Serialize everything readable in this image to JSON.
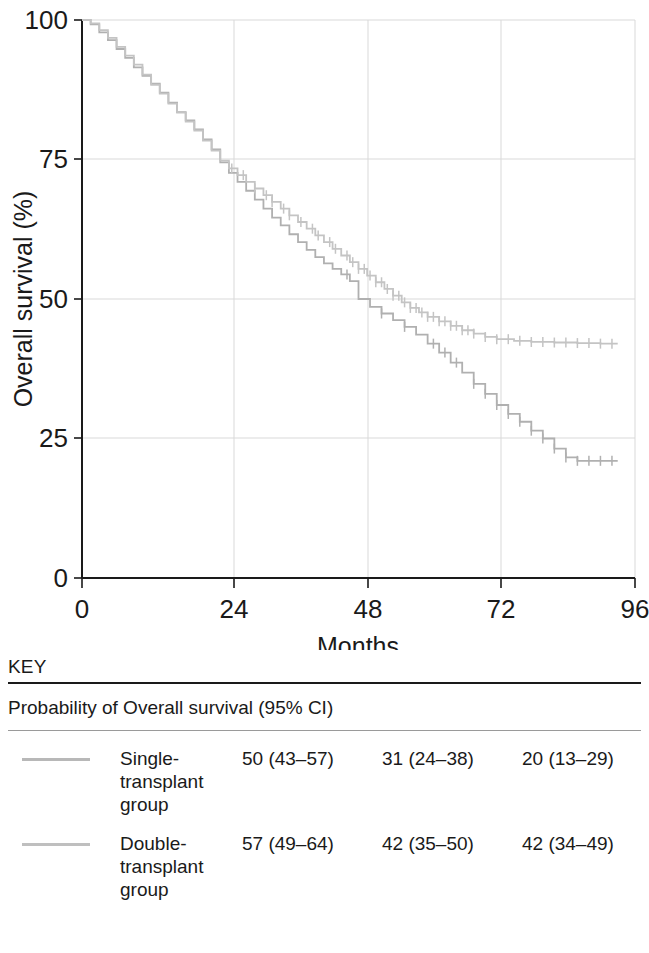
{
  "chart_data": {
    "type": "line",
    "title": "",
    "subtype": "kaplan-meier-survival",
    "xlabel": "Months",
    "ylabel": "Overall survival (%)",
    "xlim": [
      0,
      96
    ],
    "ylim": [
      0,
      100
    ],
    "xticks": [
      "0",
      "24",
      "48",
      "72",
      "96"
    ],
    "xtick_values": [
      0,
      24,
      48,
      72,
      96
    ],
    "yticks": [
      "0",
      "25",
      "50",
      "75",
      "100"
    ],
    "ytick_values": [
      0,
      25,
      50,
      75,
      100
    ],
    "grid": "horizontal-and-vertical-light",
    "legend_position": "below-plot",
    "series": [
      {
        "name": "Single-transplant group",
        "color": "#b0b0b0",
        "points": [
          [
            0,
            100
          ],
          [
            1.5,
            99.2
          ],
          [
            3,
            97.8
          ],
          [
            4.5,
            96.4
          ],
          [
            6,
            94.8
          ],
          [
            7.5,
            93.2
          ],
          [
            9,
            91.5
          ],
          [
            10.5,
            90.0
          ],
          [
            12,
            88.6
          ],
          [
            13.5,
            87.0
          ],
          [
            15,
            85.2
          ],
          [
            16.5,
            83.5
          ],
          [
            18,
            82.0
          ],
          [
            19.5,
            80.4
          ],
          [
            21,
            78.6
          ],
          [
            22.5,
            76.8
          ],
          [
            24,
            74.5
          ],
          [
            25.5,
            72.6
          ],
          [
            27,
            71.0
          ],
          [
            28.5,
            69.4
          ],
          [
            30,
            67.8
          ],
          [
            31.5,
            66.2
          ],
          [
            33,
            64.6
          ],
          [
            34.5,
            63.2
          ],
          [
            36,
            61.6
          ],
          [
            37.5,
            60.2
          ],
          [
            39,
            58.8
          ],
          [
            40.5,
            57.5
          ],
          [
            42,
            56.4
          ],
          [
            43.5,
            55.4
          ],
          [
            45,
            54.4
          ],
          [
            46.5,
            53.2
          ],
          [
            48,
            50.0
          ],
          [
            50,
            48.6
          ],
          [
            52,
            47.4
          ],
          [
            54,
            46.2
          ],
          [
            56,
            45.0
          ],
          [
            58,
            43.6
          ],
          [
            60,
            42.0
          ],
          [
            62,
            40.4
          ],
          [
            64,
            38.6
          ],
          [
            66,
            36.8
          ],
          [
            68,
            34.8
          ],
          [
            70,
            33.0
          ],
          [
            72,
            31.0
          ],
          [
            74,
            29.4
          ],
          [
            76,
            28.0
          ],
          [
            78,
            26.4
          ],
          [
            80,
            25.0
          ],
          [
            82,
            23.2
          ],
          [
            84,
            21.6
          ],
          [
            86,
            21.0
          ],
          [
            90,
            21.0
          ],
          [
            93,
            21.0
          ]
        ],
        "censor_times": [
          46,
          52,
          56,
          61,
          63,
          65,
          68,
          70,
          72,
          74,
          76,
          78,
          80,
          82,
          84,
          86,
          88,
          90,
          92
        ],
        "estimates": {
          "24_months": "50 (43–57)",
          "48_months": "31 (24–38)",
          "72_months": "20 (13–29)"
        }
      },
      {
        "name": "Double-transplant group",
        "color": "#c4c4c4",
        "points": [
          [
            0,
            100
          ],
          [
            1.5,
            99.4
          ],
          [
            3,
            98.2
          ],
          [
            4.5,
            96.8
          ],
          [
            6,
            95.2
          ],
          [
            7.5,
            93.6
          ],
          [
            9,
            92.0
          ],
          [
            10.5,
            90.2
          ],
          [
            12,
            88.4
          ],
          [
            13.5,
            86.8
          ],
          [
            15,
            85.0
          ],
          [
            16.5,
            83.4
          ],
          [
            18,
            81.8
          ],
          [
            19.5,
            80.2
          ],
          [
            21,
            78.4
          ],
          [
            22.5,
            76.6
          ],
          [
            24,
            74.8
          ],
          [
            25.5,
            73.4
          ],
          [
            27,
            72.2
          ],
          [
            28.5,
            71.0
          ],
          [
            30,
            69.8
          ],
          [
            31.5,
            68.6
          ],
          [
            33,
            67.4
          ],
          [
            34.5,
            66.2
          ],
          [
            36,
            65.0
          ],
          [
            37.5,
            63.8
          ],
          [
            39,
            62.6
          ],
          [
            40.5,
            61.4
          ],
          [
            42,
            60.2
          ],
          [
            43.5,
            59.0
          ],
          [
            45,
            57.8
          ],
          [
            46.5,
            56.6
          ],
          [
            48,
            55.4
          ],
          [
            49.5,
            54.2
          ],
          [
            51,
            53.0
          ],
          [
            52.5,
            51.8
          ],
          [
            54,
            50.6
          ],
          [
            55.5,
            49.4
          ],
          [
            57,
            48.4
          ],
          [
            58.5,
            47.6
          ],
          [
            60,
            46.8
          ],
          [
            62,
            46.0
          ],
          [
            64,
            45.2
          ],
          [
            66,
            44.4
          ],
          [
            68,
            43.8
          ],
          [
            70,
            43.2
          ],
          [
            72,
            42.8
          ],
          [
            75,
            42.5
          ],
          [
            78,
            42.3
          ],
          [
            82,
            42.2
          ],
          [
            86,
            42.1
          ],
          [
            90,
            42.0
          ],
          [
            93,
            42.0
          ]
        ],
        "censor_times": [
          26,
          28,
          30,
          32,
          33,
          35,
          36,
          38,
          40,
          41,
          43,
          44,
          46,
          47,
          48,
          49,
          50,
          51,
          52,
          53,
          54,
          55,
          56,
          57,
          58,
          59,
          60,
          61,
          62,
          63,
          64,
          65,
          66,
          67,
          68,
          70,
          72,
          74,
          76,
          78,
          80,
          82,
          84,
          86,
          88,
          90,
          92
        ],
        "estimates": {
          "24_months": "57 (49–64)",
          "48_months": "42 (35–50)",
          "72_months": "42 (34–49)"
        }
      }
    ]
  },
  "key": {
    "title": "KEY",
    "subtitle": "Probability of Overall survival (95% CI)",
    "rows": [
      {
        "label": "Single-transplant group",
        "label_lines": [
          "Single-",
          "transplant",
          "group"
        ],
        "color": "#b8b8b8",
        "values": [
          "50 (43–57)",
          "31 (24–38)",
          "20 (13–29)"
        ]
      },
      {
        "label": "Double-transplant group",
        "label_lines": [
          "Double-",
          "transplant",
          "group"
        ],
        "color": "#bfbfbf",
        "values": [
          "57 (49–64)",
          "42 (35–50)",
          "42 (34–49)"
        ]
      }
    ]
  },
  "axes": {
    "y_title": "Overall survival (%)",
    "x_title": "Months",
    "y_ticks": [
      "100",
      "75",
      "50",
      "25",
      "0"
    ],
    "x_ticks": [
      "0",
      "24",
      "48",
      "72",
      "96"
    ]
  }
}
